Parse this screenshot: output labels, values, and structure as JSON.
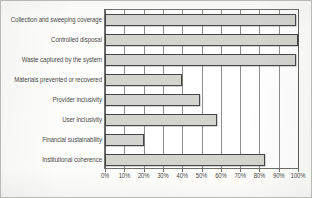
{
  "chart_data": {
    "type": "bar",
    "orientation": "horizontal",
    "title": "",
    "xlabel": "",
    "ylabel": "",
    "xlim": [
      0,
      100
    ],
    "grid": true,
    "legend": false,
    "axis_unit": "%",
    "categories": [
      "Collection and sweeping coverage",
      "Controlled disposal",
      "Waste captured by the system",
      "Materials prevented or recovered",
      "Provider inclusivity",
      "User inclusivity",
      "Financial sustainability",
      "Institutional coherence"
    ],
    "values": [
      99,
      100,
      99,
      40,
      49,
      58,
      20,
      83
    ],
    "tick_labels": [
      "0%",
      "10%",
      "20%",
      "30%",
      "40%",
      "50%",
      "60%",
      "70%",
      "80%",
      "90%",
      "100%"
    ],
    "tick_values": [
      0,
      10,
      20,
      30,
      40,
      50,
      60,
      70,
      80,
      90,
      100
    ],
    "colors": {
      "bar_fill": "#d3d3d0",
      "bar_stroke": "#46464a",
      "gridline": "#8e8e8a",
      "axis": "#6e6e6a",
      "text": "#4a4a48",
      "background": "#fdfdfc"
    }
  }
}
